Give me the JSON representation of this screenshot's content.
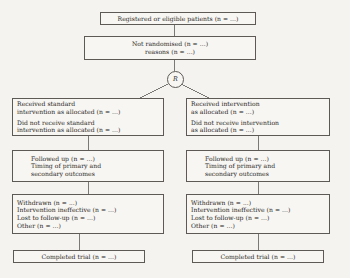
{
  "diagram": {
    "type": "flowchart",
    "background_color": "#f4f3f0",
    "border_color": "#5d5a56",
    "text_color": "#2a2724"
  },
  "nodes": {
    "registered": {
      "id": "registered-patients",
      "lines": [
        "Registered or eligible patients (n = ...)"
      ]
    },
    "not_randomised": {
      "id": "not-randomised",
      "lines": [
        "Not randomised (n = ...)",
        "reasons (n = ...)"
      ]
    },
    "randomisation": {
      "id": "randomisation-point",
      "label": "R"
    },
    "allocation_left": {
      "id": "allocation-standard-intervention",
      "group_a": [
        "Received standard",
        "intervention as allocated (n = ...)"
      ],
      "group_b": [
        "Did not receive standard",
        "intervention as allocated (n = ...)"
      ]
    },
    "allocation_right": {
      "id": "allocation-intervention",
      "group_a": [
        "Received intervention",
        "as allocated (n = ...)"
      ],
      "group_b": [
        "Did not receive intervention",
        "as allocated (n = ...)"
      ]
    },
    "followup_left": {
      "id": "followup-standard-intervention",
      "lines": [
        "Followed up (n = ...)",
        "Timing of primary and",
        "secondary outcomes"
      ]
    },
    "followup_right": {
      "id": "followup-intervention",
      "lines": [
        "Followed up (n = ...)",
        "Timing of primary and",
        "secondary outcomes"
      ]
    },
    "withdrawal_left": {
      "id": "withdrawal-standard-intervention",
      "lines": [
        "Withdrawn (n = ...)",
        "Intervention ineffective (n = ...)",
        "Lost to follow-up (n = ...)",
        "Other (n = ...)"
      ]
    },
    "withdrawal_right": {
      "id": "withdrawal-intervention",
      "lines": [
        "Withdrawn (n = ...)",
        "Intervention ineffective (n = ...)",
        "Lost to follow-up (n = ...)",
        "Other (n = ...)"
      ]
    },
    "completed_left": {
      "id": "completed-trial-standard",
      "lines": [
        "Completed trial (n = ...)"
      ]
    },
    "completed_right": {
      "id": "completed-trial-intervention",
      "lines": [
        "Completed trial (n = ...)"
      ]
    }
  }
}
